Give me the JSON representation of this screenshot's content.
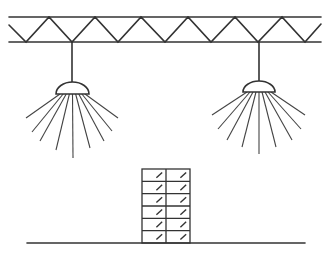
{
  "diagram": {
    "colors": {
      "line": "#333333",
      "background": "#ffffff"
    },
    "truss": {
      "x_start": 9,
      "x_end": 321,
      "top_y": 17,
      "bottom_y": 42,
      "bottom_vertices_x": [
        26,
        72,
        118,
        165,
        211,
        258,
        305
      ],
      "top_vertices_x": [
        49,
        95,
        141,
        188,
        235,
        282
      ]
    },
    "lamps": [
      {
        "name": "left-lamp",
        "cord_x": 72,
        "dome_left": 56,
        "dome_right": 89,
        "dome_top": 82,
        "dome_base": 94,
        "ray_ends": [
          [
            26,
            118
          ],
          [
            32,
            132
          ],
          [
            40,
            141
          ],
          [
            56,
            150
          ],
          [
            73,
            158
          ],
          [
            90,
            148
          ],
          [
            104,
            141
          ],
          [
            112,
            131
          ],
          [
            118,
            118
          ]
        ]
      },
      {
        "name": "right-lamp",
        "cord_x": 259,
        "dome_left": 243,
        "dome_right": 275,
        "dome_top": 81,
        "dome_base": 92,
        "ray_ends": [
          [
            212,
            115
          ],
          [
            218,
            129
          ],
          [
            227,
            140
          ],
          [
            242,
            147
          ],
          [
            259,
            154
          ],
          [
            276,
            147
          ],
          [
            292,
            140
          ],
          [
            301,
            129
          ],
          [
            305,
            115
          ]
        ]
      }
    ],
    "building": {
      "x": 142,
      "y": 169,
      "width": 48,
      "height": 74,
      "floors": 6,
      "columns": 2
    },
    "ground": {
      "x1": 27,
      "x2": 305,
      "y": 243
    }
  }
}
